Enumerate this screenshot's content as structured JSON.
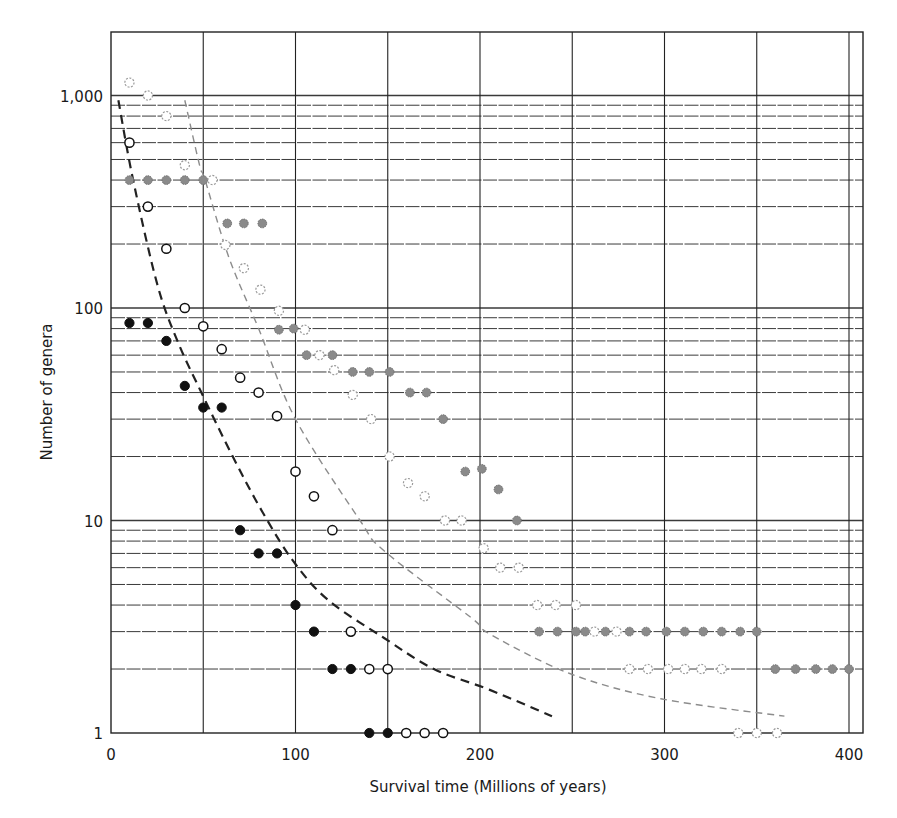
{
  "chart_data": {
    "type": "scatter",
    "title": "",
    "xlabel": "Survival time (Millions of years)",
    "ylabel": "Number of genera",
    "xlim": [
      0,
      407
    ],
    "ylim": [
      1,
      2000
    ],
    "yscale": "log",
    "grid": true,
    "x_ticks": [
      {
        "value": 0,
        "label": "0"
      },
      {
        "value": 100,
        "label": "100"
      },
      {
        "value": 200,
        "label": "200"
      },
      {
        "value": 300,
        "label": "300"
      },
      {
        "value": 400,
        "label": "400"
      }
    ],
    "x_gridlines": [
      50,
      100,
      150,
      200,
      250,
      300,
      350,
      400
    ],
    "y_ticks": [
      {
        "value": 1,
        "label": "1"
      },
      {
        "value": 10,
        "label": "10"
      },
      {
        "value": 100,
        "label": "100"
      },
      {
        "value": 1000,
        "label": "1,000"
      }
    ],
    "legend": null,
    "series": [
      {
        "name": "black-filled",
        "marker": "filled",
        "color": "#111111",
        "points": [
          [
            10,
            85
          ],
          [
            20,
            85
          ],
          [
            30,
            70
          ],
          [
            40,
            43
          ],
          [
            50,
            34
          ],
          [
            60,
            34
          ],
          [
            70,
            9
          ],
          [
            80,
            7
          ],
          [
            90,
            7
          ],
          [
            100,
            4
          ],
          [
            110,
            3
          ],
          [
            120,
            2
          ],
          [
            130,
            2
          ],
          [
            140,
            1
          ],
          [
            150,
            1
          ]
        ]
      },
      {
        "name": "black-open",
        "marker": "open",
        "color": "#111111",
        "points": [
          [
            10,
            600
          ],
          [
            20,
            300
          ],
          [
            30,
            190
          ],
          [
            40,
            100
          ],
          [
            50,
            82
          ],
          [
            60,
            64
          ],
          [
            70,
            47
          ],
          [
            80,
            40
          ],
          [
            90,
            31
          ],
          [
            100,
            17
          ],
          [
            110,
            13
          ],
          [
            120,
            9
          ],
          [
            130,
            3
          ],
          [
            140,
            2
          ],
          [
            150,
            2
          ],
          [
            160,
            1
          ],
          [
            170,
            1
          ],
          [
            180,
            1
          ]
        ]
      },
      {
        "name": "gray-filled",
        "marker": "filled",
        "color": "#8a8a8a",
        "points": [
          [
            10,
            400
          ],
          [
            20,
            400
          ],
          [
            30,
            400
          ],
          [
            40,
            400
          ],
          [
            50,
            400
          ],
          [
            63,
            250
          ],
          [
            72,
            250
          ],
          [
            82,
            250
          ],
          [
            91,
            79
          ],
          [
            99,
            80
          ],
          [
            106,
            60
          ],
          [
            120,
            60
          ],
          [
            131,
            50
          ],
          [
            140,
            50
          ],
          [
            151,
            50
          ],
          [
            162,
            40
          ],
          [
            171,
            40
          ],
          [
            180,
            30
          ],
          [
            192,
            17
          ],
          [
            201,
            17.5
          ],
          [
            210,
            14
          ],
          [
            220,
            10
          ],
          [
            232,
            3
          ],
          [
            242,
            3
          ],
          [
            252,
            3
          ],
          [
            257,
            3
          ],
          [
            268,
            3
          ],
          [
            281,
            3
          ],
          [
            290,
            3
          ],
          [
            301,
            3
          ],
          [
            311,
            3
          ],
          [
            321,
            3
          ],
          [
            331,
            3
          ],
          [
            341,
            3
          ],
          [
            350,
            3
          ],
          [
            360,
            2
          ],
          [
            371,
            2
          ],
          [
            382,
            2
          ],
          [
            391,
            2
          ],
          [
            400,
            2
          ]
        ]
      },
      {
        "name": "gray-open",
        "marker": "open-dotted",
        "color": "#9a9a9a",
        "points": [
          [
            10,
            1150
          ],
          [
            20,
            1000
          ],
          [
            30,
            800
          ],
          [
            40,
            470
          ],
          [
            55,
            400
          ],
          [
            62,
            198
          ],
          [
            72,
            154
          ],
          [
            81,
            122
          ],
          [
            91,
            97
          ],
          [
            105,
            79
          ],
          [
            113,
            60
          ],
          [
            121,
            51
          ],
          [
            131,
            39
          ],
          [
            141,
            30
          ],
          [
            151,
            20
          ],
          [
            161,
            15
          ],
          [
            170,
            13
          ],
          [
            181,
            10
          ],
          [
            190,
            10
          ],
          [
            202,
            7.4
          ],
          [
            211,
            6
          ],
          [
            221,
            6
          ],
          [
            231,
            4
          ],
          [
            241,
            4
          ],
          [
            252,
            4
          ],
          [
            262,
            3
          ],
          [
            274,
            3
          ],
          [
            281,
            2
          ],
          [
            291,
            2
          ],
          [
            302,
            2
          ],
          [
            311,
            2
          ],
          [
            320,
            2
          ],
          [
            331,
            2
          ],
          [
            340,
            1
          ],
          [
            350,
            1
          ],
          [
            361,
            1
          ]
        ]
      }
    ],
    "curves": [
      {
        "name": "black-dashed-fit",
        "color": "#222222",
        "width": 2.2,
        "dash": "9,6",
        "points": [
          [
            4,
            950
          ],
          [
            12,
            400
          ],
          [
            25,
            130
          ],
          [
            36,
            70
          ],
          [
            49,
            40
          ],
          [
            66,
            20
          ],
          [
            82,
            11
          ],
          [
            99,
            6.4
          ],
          [
            118,
            4.2
          ],
          [
            148,
            2.8
          ],
          [
            175,
            2.0
          ],
          [
            205,
            1.6
          ],
          [
            239,
            1.2
          ]
        ]
      },
      {
        "name": "gray-dashed-fit",
        "color": "#8c8c8c",
        "width": 1.4,
        "dash": "7,5",
        "points": [
          [
            40,
            950
          ],
          [
            48,
            470
          ],
          [
            51,
            400
          ],
          [
            64,
            172
          ],
          [
            80,
            80
          ],
          [
            100,
            30
          ],
          [
            135,
            10
          ],
          [
            148,
            7.2
          ],
          [
            195,
            3.5
          ],
          [
            206,
            2.9
          ],
          [
            249,
            1.9
          ],
          [
            298,
            1.45
          ],
          [
            365,
            1.2
          ]
        ]
      }
    ]
  }
}
